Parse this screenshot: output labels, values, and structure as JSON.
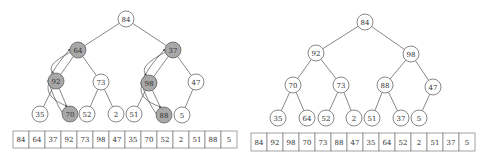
{
  "colors": {
    "edge": "#555555",
    "node_stroke": "#555555",
    "node_fill": "#ffffff",
    "highlight_fill": "#a8a8a8",
    "cell_stroke": "#666666",
    "text": "#333333"
  },
  "left_heap": {
    "description": "Heap before heapify with swap arrows",
    "nodes": [
      {
        "id": 0,
        "value": "84",
        "x": 126,
        "y": 19,
        "highlight": false
      },
      {
        "id": 1,
        "value": "64",
        "x": 78,
        "y": 50,
        "highlight": true
      },
      {
        "id": 2,
        "value": "37",
        "x": 173,
        "y": 50,
        "highlight": true
      },
      {
        "id": 3,
        "value": "92",
        "x": 56,
        "y": 81,
        "highlight": true
      },
      {
        "id": 4,
        "value": "73",
        "x": 101,
        "y": 82,
        "highlight": false
      },
      {
        "id": 5,
        "value": "98",
        "x": 149,
        "y": 83,
        "highlight": true
      },
      {
        "id": 6,
        "value": "47",
        "x": 196,
        "y": 82,
        "highlight": false
      },
      {
        "id": 7,
        "value": "35",
        "x": 40,
        "y": 114,
        "highlight": false
      },
      {
        "id": 8,
        "value": "70",
        "x": 70,
        "y": 114,
        "highlight": true
      },
      {
        "id": 9,
        "value": "52",
        "x": 87,
        "y": 114,
        "highlight": false
      },
      {
        "id": 10,
        "value": "2",
        "x": 116,
        "y": 114,
        "highlight": false
      },
      {
        "id": 11,
        "value": "51",
        "x": 134,
        "y": 114,
        "highlight": false
      },
      {
        "id": 12,
        "value": "88",
        "x": 164,
        "y": 115,
        "highlight": true
      },
      {
        "id": 13,
        "value": "5",
        "x": 182,
        "y": 115,
        "highlight": false
      }
    ],
    "edges": [
      [
        0,
        1
      ],
      [
        0,
        2
      ],
      [
        1,
        3
      ],
      [
        1,
        4
      ],
      [
        2,
        5
      ],
      [
        2,
        6
      ],
      [
        3,
        7
      ],
      [
        3,
        8
      ],
      [
        4,
        9
      ],
      [
        4,
        10
      ],
      [
        5,
        11
      ],
      [
        5,
        12
      ],
      [
        6,
        13
      ]
    ],
    "swap_arrows": [
      {
        "from": 1,
        "to": 3
      },
      {
        "from": 3,
        "to": 8
      },
      {
        "from": 2,
        "to": 5
      },
      {
        "from": 5,
        "to": 12
      }
    ],
    "array": {
      "x": 13,
      "y": 131,
      "cell_w": 16,
      "cell_h": 17,
      "values": [
        "84",
        "64",
        "37",
        "92",
        "73",
        "98",
        "47",
        "35",
        "70",
        "52",
        "2",
        "51",
        "88",
        "5"
      ]
    }
  },
  "right_heap": {
    "description": "Heap after heapify",
    "nodes": [
      {
        "id": 0,
        "value": "84",
        "x": 365,
        "y": 22,
        "highlight": false
      },
      {
        "id": 1,
        "value": "92",
        "x": 316,
        "y": 53,
        "highlight": false
      },
      {
        "id": 2,
        "value": "98",
        "x": 411,
        "y": 54,
        "highlight": false
      },
      {
        "id": 3,
        "value": "70",
        "x": 293,
        "y": 85,
        "highlight": false
      },
      {
        "id": 4,
        "value": "73",
        "x": 341,
        "y": 85,
        "highlight": false
      },
      {
        "id": 5,
        "value": "88",
        "x": 385,
        "y": 85,
        "highlight": false
      },
      {
        "id": 6,
        "value": "47",
        "x": 433,
        "y": 87,
        "highlight": false
      },
      {
        "id": 7,
        "value": "35",
        "x": 278,
        "y": 118,
        "highlight": false
      },
      {
        "id": 8,
        "value": "64",
        "x": 307,
        "y": 118,
        "highlight": false
      },
      {
        "id": 9,
        "value": "52",
        "x": 326,
        "y": 118,
        "highlight": false
      },
      {
        "id": 10,
        "value": "2",
        "x": 354,
        "y": 118,
        "highlight": false
      },
      {
        "id": 11,
        "value": "51",
        "x": 372,
        "y": 118,
        "highlight": false
      },
      {
        "id": 12,
        "value": "37",
        "x": 401,
        "y": 118,
        "highlight": false
      },
      {
        "id": 13,
        "value": "5",
        "x": 419,
        "y": 118,
        "highlight": false
      }
    ],
    "edges": [
      [
        0,
        1
      ],
      [
        0,
        2
      ],
      [
        1,
        3
      ],
      [
        1,
        4
      ],
      [
        2,
        5
      ],
      [
        2,
        6
      ],
      [
        3,
        7
      ],
      [
        3,
        8
      ],
      [
        4,
        9
      ],
      [
        4,
        10
      ],
      [
        5,
        11
      ],
      [
        5,
        12
      ],
      [
        6,
        13
      ]
    ],
    "swap_arrows": [],
    "array": {
      "x": 251,
      "y": 133,
      "cell_w": 16,
      "cell_h": 18,
      "values": [
        "84",
        "92",
        "98",
        "70",
        "73",
        "88",
        "47",
        "35",
        "64",
        "52",
        "2",
        "51",
        "37",
        "5"
      ]
    }
  }
}
